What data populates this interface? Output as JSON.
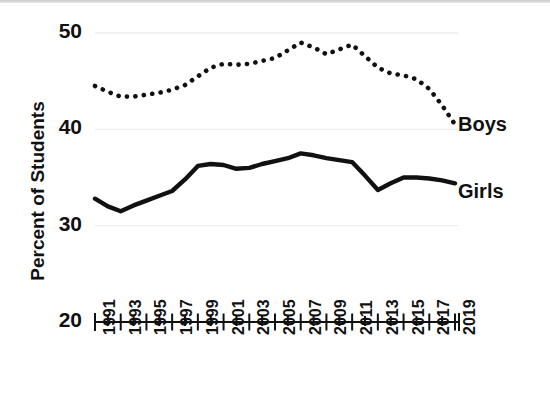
{
  "chart_data": {
    "type": "line",
    "title": "",
    "subtitle": "",
    "xlabel": "",
    "ylabel": "Percent of Students",
    "ylim": [
      20,
      50
    ],
    "xlim": [
      1991,
      2019
    ],
    "yticks": [
      20,
      30,
      40,
      50
    ],
    "ytick_labels": [
      "20",
      "30",
      "40",
      "50"
    ],
    "xticks": [
      1991,
      1993,
      1995,
      1997,
      1999,
      2001,
      2003,
      2005,
      2007,
      2009,
      2011,
      2013,
      2015,
      2017,
      2019
    ],
    "xtick_labels": [
      "1991",
      "1993",
      "1995",
      "1997",
      "1999",
      "2001",
      "2003",
      "2005",
      "2007",
      "2009",
      "2011",
      "2013",
      "2015",
      "2017",
      "2019"
    ],
    "grid": true,
    "legend": "inline-right",
    "x": [
      1991,
      1992,
      1993,
      1994,
      1995,
      1996,
      1997,
      1998,
      1999,
      2000,
      2001,
      2002,
      2003,
      2004,
      2005,
      2006,
      2007,
      2008,
      2009,
      2010,
      2011,
      2012,
      2013,
      2014,
      2015,
      2016,
      2017,
      2018,
      2019
    ],
    "series": [
      {
        "name": "Boys",
        "style": "dotted",
        "color": "#111111",
        "values": [
          44.5,
          43.9,
          43.4,
          43.4,
          43.6,
          43.8,
          44.1,
          44.6,
          45.5,
          46.4,
          46.8,
          46.7,
          46.8,
          47.1,
          47.4,
          48.2,
          49.0,
          48.5,
          47.8,
          48.3,
          48.8,
          47.6,
          46.4,
          45.8,
          45.6,
          45.2,
          44.2,
          42.5,
          40.5
        ]
      },
      {
        "name": "Girls",
        "style": "solid",
        "color": "#111111",
        "values": [
          32.8,
          32.0,
          31.5,
          32.1,
          32.6,
          33.1,
          33.6,
          34.8,
          36.2,
          36.4,
          36.3,
          35.9,
          36.0,
          36.4,
          36.7,
          37.0,
          37.5,
          37.3,
          37.0,
          36.8,
          36.6,
          35.2,
          33.7,
          34.4,
          35.0,
          35.0,
          34.9,
          34.7,
          34.4
        ]
      }
    ],
    "annotations": [
      {
        "text": "Boys",
        "x": 2019,
        "y": 40.3
      },
      {
        "text": "Girls",
        "x": 2019,
        "y": 33.4
      }
    ]
  }
}
